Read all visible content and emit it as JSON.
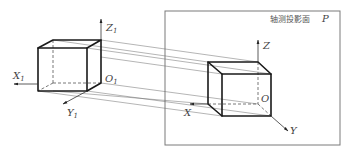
{
  "diagram": {
    "plane": {
      "title": "轴测投影面",
      "symbol": "P"
    },
    "left_axes": {
      "x": {
        "letter": "X",
        "sub": "1"
      },
      "y": {
        "letter": "Y",
        "sub": "1"
      },
      "z": {
        "letter": "Z",
        "sub": "1"
      },
      "origin": {
        "letter": "O",
        "sub": "1"
      }
    },
    "right_axes": {
      "x": {
        "letter": "X"
      },
      "y": {
        "letter": "Y"
      },
      "z": {
        "letter": "Z"
      },
      "origin": {
        "letter": "O"
      }
    },
    "colors": {
      "edge": "#1a1a1a",
      "projection_line": "#6a6a6a",
      "frame": "#7a7a7a"
    }
  }
}
